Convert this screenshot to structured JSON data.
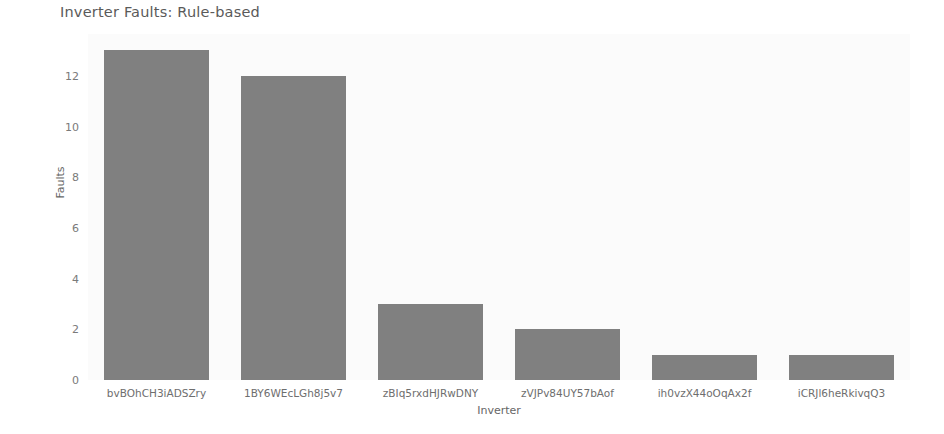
{
  "chart_data": {
    "type": "bar",
    "title": "Inverter Faults: Rule-based",
    "xlabel": "Inverter",
    "ylabel": "Faults",
    "categories": [
      "bvBOhCH3iADSZry",
      "1BY6WEcLGh8j5v7",
      "zBIq5rxdHJRwDNY",
      "zVJPv84UY57bAof",
      "ih0vzX44oOqAx2f",
      "iCRJl6heRkivqQ3"
    ],
    "values": [
      13,
      12,
      3,
      2,
      1,
      1
    ],
    "yticks": [
      0,
      2,
      4,
      6,
      8,
      10,
      12
    ],
    "ylim": [
      0,
      13.65
    ],
    "grid": false,
    "legend": null,
    "bar_color": "#808080",
    "plot_background": "#fbfbfb",
    "figure_background": "#ffffff",
    "text_color": "#5a5a5a"
  }
}
